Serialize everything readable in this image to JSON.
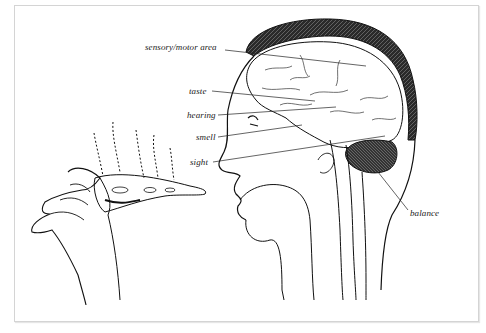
{
  "figure": {
    "labels": {
      "sensory_motor": "sensory/motor area",
      "taste": "taste",
      "hearing": "hearing",
      "smell": "smell",
      "sight": "sight",
      "balance": "balance"
    }
  },
  "colors": {
    "ink": "#1a1a1a",
    "frame": "#d4d4d4",
    "background": "#ffffff"
  }
}
